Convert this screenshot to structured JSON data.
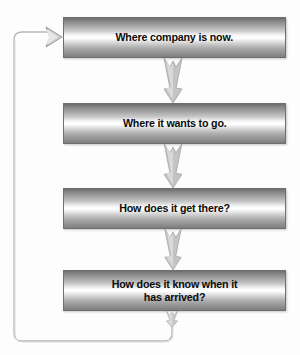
{
  "diagram": {
    "background_color": "#fdfdfd",
    "box_edge_color": "#6f6f6f",
    "text_color": "#0b0b0b",
    "connector_color": "#b0b0b0",
    "steps": [
      {
        "id": "step-1",
        "label": "Where company is now."
      },
      {
        "id": "step-2",
        "label": "Where it wants to go."
      },
      {
        "id": "step-3",
        "label": "How does it get there?"
      },
      {
        "id": "step-4",
        "label": "How does it know when it\nhas arrived?"
      }
    ],
    "connectors": [
      {
        "id": "connector-1",
        "from": "step-1",
        "to": "step-2",
        "direction": "down"
      },
      {
        "id": "connector-2",
        "from": "step-2",
        "to": "step-3",
        "direction": "down"
      },
      {
        "id": "connector-3",
        "from": "step-3",
        "to": "step-4",
        "direction": "down"
      },
      {
        "id": "connector-4",
        "from": "step-4",
        "to": "feedback-loop",
        "direction": "down"
      }
    ],
    "feedback_loop": {
      "id": "feedback-loop",
      "from": "step-4",
      "to": "step-1",
      "direction": "right",
      "arrowhead": "right"
    }
  }
}
